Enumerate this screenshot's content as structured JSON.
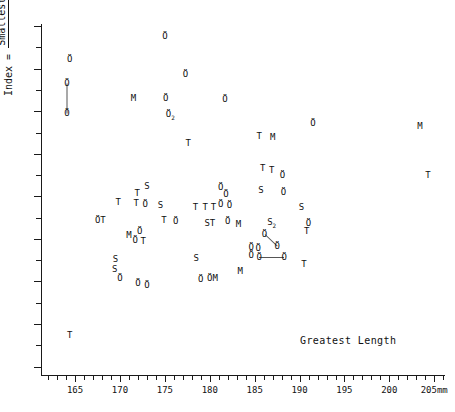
{
  "chart_data": {
    "type": "scatter",
    "title": "",
    "xlabel": "Greatest Length",
    "ylabel_numerator": "Smallest Breadth of diaphysis x 100",
    "ylabel_denominator": "Greatest Length",
    "ylabel_prefix": "Index = ",
    "xunit": "mm",
    "xlim": [
      161.2,
      206.2
    ],
    "ylim": [
      11.8,
      20.05
    ],
    "x_major_ticks": [
      165,
      170,
      175,
      180,
      185,
      190,
      195,
      200,
      205
    ],
    "x_major_labels": [
      "165",
      "170",
      "175",
      "180",
      "185",
      "190",
      "195",
      "200",
      "205mm"
    ],
    "x_minor_step": 1,
    "y_major_ticks": [
      12,
      13,
      14,
      15,
      16,
      17,
      18,
      19,
      20
    ],
    "y_major_labels": [
      "12",
      "13",
      "14",
      "15",
      "16",
      "17",
      "18",
      "19",
      "20"
    ],
    "y_minor_ticks": [
      12.5,
      13.5,
      14.5,
      15.5,
      16.5,
      17.5,
      18.5,
      19.5
    ],
    "y_minor_labels": [
      "5",
      "5",
      "5",
      "5",
      "5",
      "5",
      "5",
      "5"
    ],
    "grid": false,
    "legend": "none",
    "marker_kinds": [
      "Ö",
      "T",
      "S",
      "M"
    ],
    "points": [
      {
        "label": "Ö",
        "x": 175.0,
        "y": 19.76
      },
      {
        "label": "Ö",
        "x": 164.4,
        "y": 19.22
      },
      {
        "label": "Ö",
        "x": 177.3,
        "y": 18.88
      },
      {
        "label": "Ö",
        "x": 164.1,
        "y": 18.66
      },
      {
        "label": "M",
        "x": 171.5,
        "y": 18.32
      },
      {
        "label": "Ö",
        "x": 175.1,
        "y": 18.32
      },
      {
        "label": "Ö",
        "x": 181.7,
        "y": 18.3
      },
      {
        "label": "Ö",
        "x": 164.1,
        "y": 17.96
      },
      {
        "label": "Ö₂",
        "x": 175.6,
        "y": 17.88
      },
      {
        "label": "Ö",
        "x": 191.5,
        "y": 17.72
      },
      {
        "label": "M",
        "x": 203.4,
        "y": 17.66
      },
      {
        "label": "M",
        "x": 187.0,
        "y": 17.4
      },
      {
        "label": "T",
        "x": 185.5,
        "y": 17.43
      },
      {
        "label": "T",
        "x": 177.6,
        "y": 17.26
      },
      {
        "label": "T",
        "x": 204.3,
        "y": 16.5
      },
      {
        "label": "T",
        "x": 185.9,
        "y": 16.66
      },
      {
        "label": "T",
        "x": 186.9,
        "y": 16.62
      },
      {
        "label": "Ö",
        "x": 188.1,
        "y": 16.5
      },
      {
        "label": "S",
        "x": 173.0,
        "y": 16.24
      },
      {
        "label": "Ö",
        "x": 181.2,
        "y": 16.22
      },
      {
        "label": "S",
        "x": 185.7,
        "y": 16.16
      },
      {
        "label": "Ö",
        "x": 188.2,
        "y": 16.1
      },
      {
        "label": "T",
        "x": 171.9,
        "y": 16.08
      },
      {
        "label": "Ö",
        "x": 181.8,
        "y": 16.06
      },
      {
        "label": "T",
        "x": 169.8,
        "y": 15.86
      },
      {
        "label": "T",
        "x": 171.8,
        "y": 15.84
      },
      {
        "label": "Ö",
        "x": 172.8,
        "y": 15.82
      },
      {
        "label": "S",
        "x": 174.5,
        "y": 15.8
      },
      {
        "label": "T",
        "x": 178.4,
        "y": 15.76
      },
      {
        "label": "T",
        "x": 179.5,
        "y": 15.74
      },
      {
        "label": "T",
        "x": 180.4,
        "y": 15.74
      },
      {
        "label": "Ö",
        "x": 181.2,
        "y": 15.82
      },
      {
        "label": "Ö",
        "x": 182.2,
        "y": 15.8
      },
      {
        "label": "S",
        "x": 190.2,
        "y": 15.74
      },
      {
        "label": "ÖT",
        "x": 167.8,
        "y": 15.44
      },
      {
        "label": "T",
        "x": 174.9,
        "y": 15.44
      },
      {
        "label": "Ö",
        "x": 176.2,
        "y": 15.42
      },
      {
        "label": "ST",
        "x": 180.0,
        "y": 15.38
      },
      {
        "label": "Ö",
        "x": 182.0,
        "y": 15.42
      },
      {
        "label": "M",
        "x": 183.2,
        "y": 15.36
      },
      {
        "label": "S₂",
        "x": 186.9,
        "y": 15.36
      },
      {
        "label": "Ö",
        "x": 191.0,
        "y": 15.38
      },
      {
        "label": "T",
        "x": 190.8,
        "y": 15.18
      },
      {
        "label": "M",
        "x": 171.0,
        "y": 15.1
      },
      {
        "label": "Ö",
        "x": 172.2,
        "y": 15.18
      },
      {
        "label": "Ö",
        "x": 171.7,
        "y": 14.98
      },
      {
        "label": "T",
        "x": 172.6,
        "y": 14.94
      },
      {
        "label": "Ö",
        "x": 186.1,
        "y": 15.12
      },
      {
        "label": "Ö",
        "x": 184.6,
        "y": 14.82
      },
      {
        "label": "Ö",
        "x": 185.4,
        "y": 14.78
      },
      {
        "label": "Ö",
        "x": 187.5,
        "y": 14.84
      },
      {
        "label": "Ö",
        "x": 184.6,
        "y": 14.62
      },
      {
        "label": "Ö",
        "x": 185.5,
        "y": 14.58
      },
      {
        "label": "Ö",
        "x": 188.3,
        "y": 14.58
      },
      {
        "label": "S",
        "x": 169.5,
        "y": 14.52
      },
      {
        "label": "S",
        "x": 178.5,
        "y": 14.56
      },
      {
        "label": "T",
        "x": 190.5,
        "y": 14.4
      },
      {
        "label": "S",
        "x": 169.4,
        "y": 14.3
      },
      {
        "label": "M",
        "x": 183.4,
        "y": 14.24
      },
      {
        "label": "Ö",
        "x": 170.0,
        "y": 14.08
      },
      {
        "label": "ÖM",
        "x": 180.3,
        "y": 14.08
      },
      {
        "label": "Ö",
        "x": 179.0,
        "y": 14.06
      },
      {
        "label": "Ö",
        "x": 172.0,
        "y": 13.96
      },
      {
        "label": "Ö",
        "x": 173.0,
        "y": 13.92
      },
      {
        "label": "T",
        "x": 164.4,
        "y": 12.74
      }
    ],
    "links": [
      {
        "x1": 164.1,
        "y1": 18.66,
        "x2": 164.1,
        "y2": 17.96
      },
      {
        "x1": 186.1,
        "y1": 15.12,
        "x2": 187.5,
        "y2": 14.84
      },
      {
        "x1": 185.5,
        "y1": 14.58,
        "x2": 188.3,
        "y2": 14.58
      }
    ]
  },
  "colors": {
    "axis": "#1a1a1a",
    "text": "#111111",
    "marker": "#111111",
    "link": "#555555",
    "background": "#ffffff"
  }
}
